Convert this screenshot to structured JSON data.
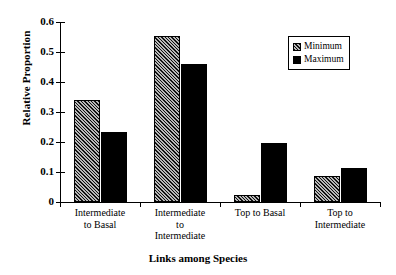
{
  "chart_data": {
    "type": "bar",
    "title": "",
    "xlabel": "Links among Species",
    "ylabel": "Relative Proportion",
    "categories": [
      "Intermediate to Basal",
      "Intermediate to Intermediate",
      "Top to Basal",
      "Top to Intermediate"
    ],
    "category_lines": [
      [
        "Intermediate",
        "to Basal"
      ],
      [
        "Intermediate",
        "to",
        "Intermediate"
      ],
      [
        "Top to Basal"
      ],
      [
        "Top to",
        "Intermediate"
      ]
    ],
    "series": [
      {
        "name": "Minimum",
        "values": [
          0.34,
          0.553,
          0.025,
          0.087
        ]
      },
      {
        "name": "Maximum",
        "values": [
          0.233,
          0.46,
          0.196,
          0.113
        ]
      }
    ],
    "ylim": [
      0,
      0.6
    ],
    "yticks": [
      0,
      0.1,
      0.2,
      0.3,
      0.4,
      0.5,
      0.6
    ],
    "ytick_labels": [
      "0",
      "0.1",
      "0.2",
      "0.3",
      "0.4",
      "0.5",
      "0.6"
    ],
    "grid": false,
    "legend_position": "top-right",
    "colors": {
      "minimum": "#b8b8b8",
      "maximum": "#000000",
      "axis": "#000000"
    }
  },
  "legend": {
    "items": [
      {
        "label": "Minimum",
        "style": "hatched"
      },
      {
        "label": "Maximum",
        "style": "solid"
      }
    ]
  }
}
